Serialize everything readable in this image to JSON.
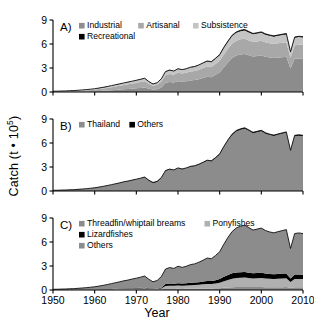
{
  "figure": {
    "axis_label_y": "Catch (t • 10",
    "axis_label_y_exp": "5",
    "axis_label_y_close": ")",
    "axis_label_x": "Year",
    "panel_labels": [
      "A)",
      "B)",
      "C)"
    ]
  },
  "colors": {
    "industrial": "#8c8c8c",
    "artisanal": "#a8a8a8",
    "subsistence": "#c4c4c4",
    "recreational": "#000000",
    "thailand": "#8c8c8c",
    "others_b": "#000000",
    "threadfin": "#8c8c8c",
    "ponyfishes": "#b0b0b0",
    "lizardfishes": "#000000",
    "others_c": "#8c8c8c",
    "axis": "#000000",
    "background": "#ffffff"
  },
  "chart_data": [
    {
      "type": "area",
      "panel": "A)",
      "title": "",
      "xlabel": "Year",
      "ylabel": "Catch (t • 10^5)",
      "xlim": [
        1950,
        2010
      ],
      "ylim": [
        0,
        9
      ],
      "xticks": [
        1950,
        1960,
        1970,
        1980,
        1990,
        2000,
        2010
      ],
      "yticks": [
        0,
        3,
        6,
        9
      ],
      "grid": false,
      "legend_position": "top-left",
      "stacked": true,
      "legend": [
        "Industrial",
        "Artisanal",
        "Subsistence",
        "Recreational"
      ],
      "x": [
        1950,
        1951,
        1952,
        1953,
        1954,
        1955,
        1956,
        1957,
        1958,
        1959,
        1960,
        1961,
        1962,
        1963,
        1964,
        1965,
        1966,
        1967,
        1968,
        1969,
        1970,
        1971,
        1972,
        1973,
        1974,
        1975,
        1976,
        1977,
        1978,
        1979,
        1980,
        1981,
        1982,
        1983,
        1984,
        1985,
        1986,
        1987,
        1988,
        1989,
        1990,
        1991,
        1992,
        1993,
        1994,
        1995,
        1996,
        1997,
        1998,
        1999,
        2000,
        2001,
        2002,
        2003,
        2004,
        2005,
        2006,
        2007,
        2008,
        2009,
        2010
      ],
      "series": [
        {
          "name": "Industrial",
          "values": [
            0.02,
            0.02,
            0.03,
            0.03,
            0.04,
            0.04,
            0.05,
            0.06,
            0.07,
            0.08,
            0.1,
            0.12,
            0.15,
            0.18,
            0.22,
            0.26,
            0.3,
            0.34,
            0.38,
            0.42,
            0.46,
            0.5,
            0.55,
            0.4,
            0.3,
            0.35,
            0.55,
            1.15,
            1.25,
            1.2,
            1.35,
            1.3,
            1.35,
            1.45,
            1.5,
            1.6,
            1.75,
            1.9,
            1.85,
            2.15,
            2.45,
            3.1,
            3.7,
            4.25,
            4.55,
            4.7,
            4.75,
            4.6,
            4.45,
            4.5,
            4.55,
            4.4,
            4.3,
            4.25,
            4.3,
            4.35,
            4.4,
            2.95,
            4.15,
            4.2,
            4.2
          ]
        },
        {
          "name": "Artisanal",
          "values": [
            0.04,
            0.05,
            0.05,
            0.06,
            0.07,
            0.08,
            0.1,
            0.12,
            0.14,
            0.17,
            0.2,
            0.24,
            0.28,
            0.33,
            0.38,
            0.43,
            0.48,
            0.53,
            0.58,
            0.63,
            0.68,
            0.74,
            0.8,
            0.62,
            0.48,
            0.55,
            0.75,
            0.95,
            1.0,
            0.95,
            1.05,
            1.0,
            1.05,
            1.1,
            1.12,
            1.18,
            1.25,
            1.3,
            1.28,
            1.35,
            1.45,
            1.6,
            1.7,
            1.8,
            1.85,
            1.88,
            1.9,
            1.85,
            1.8,
            1.82,
            1.85,
            1.8,
            1.78,
            1.75,
            1.78,
            1.8,
            1.82,
            1.3,
            1.7,
            1.72,
            1.7
          ]
        },
        {
          "name": "Subsistence",
          "values": [
            0.03,
            0.03,
            0.04,
            0.04,
            0.05,
            0.05,
            0.06,
            0.07,
            0.08,
            0.09,
            0.1,
            0.12,
            0.14,
            0.16,
            0.18,
            0.2,
            0.22,
            0.24,
            0.26,
            0.28,
            0.3,
            0.32,
            0.34,
            0.26,
            0.2,
            0.24,
            0.32,
            0.42,
            0.45,
            0.43,
            0.47,
            0.45,
            0.47,
            0.5,
            0.52,
            0.55,
            0.58,
            0.62,
            0.6,
            0.65,
            0.7,
            0.8,
            0.88,
            0.95,
            1.0,
            1.02,
            1.05,
            1.0,
            0.96,
            0.98,
            1.0,
            0.96,
            0.94,
            0.92,
            0.94,
            0.96,
            0.98,
            0.7,
            0.92,
            0.94,
            0.92
          ]
        },
        {
          "name": "Recreational",
          "values": [
            0.005,
            0.005,
            0.005,
            0.006,
            0.006,
            0.007,
            0.007,
            0.008,
            0.009,
            0.01,
            0.011,
            0.012,
            0.013,
            0.015,
            0.016,
            0.018,
            0.02,
            0.022,
            0.024,
            0.026,
            0.028,
            0.03,
            0.032,
            0.026,
            0.022,
            0.025,
            0.032,
            0.04,
            0.045,
            0.044,
            0.048,
            0.046,
            0.048,
            0.05,
            0.052,
            0.055,
            0.058,
            0.062,
            0.06,
            0.066,
            0.072,
            0.085,
            0.095,
            0.105,
            0.11,
            0.115,
            0.118,
            0.112,
            0.106,
            0.108,
            0.112,
            0.106,
            0.102,
            0.1,
            0.104,
            0.108,
            0.112,
            0.08,
            0.1,
            0.104,
            0.1
          ]
        }
      ]
    },
    {
      "type": "area",
      "panel": "B)",
      "title": "",
      "xlabel": "Year",
      "ylabel": "Catch (t • 10^5)",
      "xlim": [
        1950,
        2010
      ],
      "ylim": [
        0,
        9
      ],
      "xticks": [
        1950,
        1960,
        1970,
        1980,
        1990,
        2000,
        2010
      ],
      "yticks": [
        0,
        3,
        6,
        9
      ],
      "grid": false,
      "legend_position": "top-left",
      "stacked": true,
      "legend": [
        "Thailand",
        "Others"
      ],
      "x": [
        1950,
        1951,
        1952,
        1953,
        1954,
        1955,
        1956,
        1957,
        1958,
        1959,
        1960,
        1961,
        1962,
        1963,
        1964,
        1965,
        1966,
        1967,
        1968,
        1969,
        1970,
        1971,
        1972,
        1973,
        1974,
        1975,
        1976,
        1977,
        1978,
        1979,
        1980,
        1981,
        1982,
        1983,
        1984,
        1985,
        1986,
        1987,
        1988,
        1989,
        1990,
        1991,
        1992,
        1993,
        1994,
        1995,
        1996,
        1997,
        1998,
        1999,
        2000,
        2001,
        2002,
        2003,
        2004,
        2005,
        2006,
        2007,
        2008,
        2009,
        2010
      ],
      "series": [
        {
          "name": "Thailand",
          "values": [
            0.08,
            0.09,
            0.11,
            0.12,
            0.15,
            0.16,
            0.2,
            0.24,
            0.28,
            0.33,
            0.39,
            0.47,
            0.56,
            0.66,
            0.77,
            0.88,
            0.99,
            1.12,
            1.21,
            1.33,
            1.44,
            1.56,
            1.7,
            1.28,
            0.98,
            1.13,
            1.61,
            2.5,
            2.68,
            2.58,
            2.83,
            2.7,
            2.83,
            3.02,
            3.1,
            3.28,
            3.52,
            3.78,
            3.7,
            4.1,
            4.56,
            5.48,
            6.3,
            7.0,
            7.45,
            7.65,
            7.78,
            7.52,
            7.22,
            7.35,
            7.47,
            7.17,
            7.0,
            6.88,
            7.02,
            7.15,
            7.27,
            5.0,
            6.85,
            6.92,
            6.85
          ]
        },
        {
          "name": "Others",
          "values": [
            0.005,
            0.005,
            0.006,
            0.006,
            0.007,
            0.008,
            0.009,
            0.01,
            0.011,
            0.012,
            0.014,
            0.016,
            0.018,
            0.02,
            0.022,
            0.025,
            0.028,
            0.03,
            0.033,
            0.036,
            0.039,
            0.042,
            0.046,
            0.07,
            0.085,
            0.08,
            0.07,
            0.06,
            0.058,
            0.056,
            0.06,
            0.058,
            0.06,
            0.062,
            0.064,
            0.066,
            0.07,
            0.074,
            0.072,
            0.078,
            0.085,
            0.095,
            0.105,
            0.112,
            0.118,
            0.12,
            0.122,
            0.118,
            0.112,
            0.114,
            0.118,
            0.112,
            0.108,
            0.106,
            0.11,
            0.114,
            0.118,
            0.085,
            0.106,
            0.11,
            0.106
          ]
        }
      ]
    },
    {
      "type": "area",
      "panel": "C)",
      "title": "",
      "xlabel": "Year",
      "ylabel": "Catch (t • 10^5)",
      "xlim": [
        1950,
        2010
      ],
      "ylim": [
        0,
        9
      ],
      "xticks": [
        1950,
        1960,
        1970,
        1980,
        1990,
        2000,
        2010
      ],
      "yticks": [
        0,
        3,
        6,
        9
      ],
      "grid": false,
      "legend_position": "top-left",
      "stacked": true,
      "legend": [
        "Threadfin/whiptail breams",
        "Ponyfishes",
        "Lizardfishes",
        "Others"
      ],
      "x": [
        1950,
        1951,
        1952,
        1953,
        1954,
        1955,
        1956,
        1957,
        1958,
        1959,
        1960,
        1961,
        1962,
        1963,
        1964,
        1965,
        1966,
        1967,
        1968,
        1969,
        1970,
        1971,
        1972,
        1973,
        1974,
        1975,
        1976,
        1977,
        1978,
        1979,
        1980,
        1981,
        1982,
        1983,
        1984,
        1985,
        1986,
        1987,
        1988,
        1989,
        1990,
        1991,
        1992,
        1993,
        1994,
        1995,
        1996,
        1997,
        1998,
        1999,
        2000,
        2001,
        2002,
        2003,
        2004,
        2005,
        2006,
        2007,
        2008,
        2009,
        2010
      ],
      "series": [
        {
          "name": "Threadfin/whiptail breams",
          "values": [
            0.004,
            0.005,
            0.005,
            0.006,
            0.007,
            0.008,
            0.01,
            0.012,
            0.014,
            0.016,
            0.019,
            0.023,
            0.028,
            0.033,
            0.038,
            0.044,
            0.049,
            0.056,
            0.06,
            0.066,
            0.072,
            0.078,
            0.085,
            0.064,
            0.049,
            0.057,
            0.08,
            0.125,
            0.134,
            0.129,
            0.141,
            0.135,
            0.141,
            0.151,
            0.155,
            0.164,
            0.176,
            0.189,
            0.185,
            0.205,
            0.228,
            0.274,
            0.315,
            0.35,
            0.372,
            0.382,
            0.389,
            0.376,
            0.361,
            0.367,
            0.373,
            0.358,
            0.35,
            0.344,
            0.351,
            0.357,
            0.363,
            0.25,
            0.342,
            0.346,
            0.342
          ]
        },
        {
          "name": "Ponyfishes",
          "values": [
            0.006,
            0.007,
            0.008,
            0.009,
            0.011,
            0.012,
            0.015,
            0.018,
            0.021,
            0.025,
            0.029,
            0.035,
            0.042,
            0.05,
            0.058,
            0.066,
            0.074,
            0.084,
            0.091,
            0.1,
            0.108,
            0.117,
            0.128,
            0.096,
            0.074,
            0.085,
            0.121,
            0.375,
            0.402,
            0.387,
            0.425,
            0.405,
            0.425,
            0.453,
            0.465,
            0.492,
            0.528,
            0.567,
            0.555,
            0.615,
            0.684,
            0.822,
            0.945,
            1.05,
            1.118,
            1.148,
            1.167,
            1.128,
            1.083,
            1.103,
            1.121,
            1.076,
            1.05,
            1.032,
            1.053,
            1.073,
            1.091,
            0.75,
            1.028,
            1.038,
            1.028
          ]
        },
        {
          "name": "Lizardfishes",
          "values": [
            0.004,
            0.005,
            0.005,
            0.006,
            0.007,
            0.008,
            0.01,
            0.012,
            0.014,
            0.016,
            0.019,
            0.023,
            0.028,
            0.033,
            0.038,
            0.044,
            0.05,
            0.056,
            0.06,
            0.066,
            0.072,
            0.078,
            0.085,
            0.064,
            0.049,
            0.057,
            0.08,
            0.25,
            0.268,
            0.258,
            0.283,
            0.27,
            0.283,
            0.302,
            0.31,
            0.328,
            0.352,
            0.378,
            0.37,
            0.41,
            0.456,
            0.548,
            0.63,
            0.7,
            0.7,
            0.68,
            0.68,
            0.66,
            0.64,
            0.65,
            0.65,
            0.63,
            0.61,
            0.6,
            0.61,
            0.62,
            0.62,
            0.45,
            0.56,
            0.56,
            0.55
          ]
        },
        {
          "name": "Others",
          "values": [
            0.072,
            0.078,
            0.098,
            0.105,
            0.132,
            0.14,
            0.175,
            0.208,
            0.242,
            0.286,
            0.337,
            0.405,
            0.478,
            0.564,
            0.661,
            0.756,
            0.856,
            0.954,
            1.032,
            1.134,
            1.228,
            1.329,
            1.448,
            1.116,
            0.853,
            0.986,
            1.399,
            1.87,
            2.004,
            1.92,
            2.121,
            2.018,
            2.121,
            2.266,
            2.334,
            2.486,
            2.664,
            2.866,
            2.792,
            3.075,
            3.413,
            4.079,
            4.695,
            5.212,
            5.573,
            5.768,
            5.866,
            5.638,
            5.403,
            5.494,
            5.591,
            5.374,
            5.248,
            5.17,
            5.276,
            5.374,
            5.474,
            3.735,
            5.126,
            5.186,
            5.136
          ]
        }
      ]
    }
  ]
}
